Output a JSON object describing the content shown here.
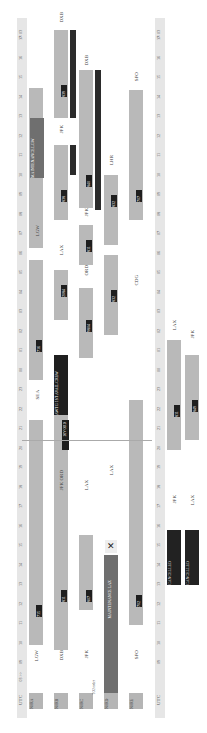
{
  "ruler": {
    "utc_label": "UTC",
    "day_label": "03 >>",
    "hours_bottom": [
      "09",
      "10",
      "11",
      "12",
      "13",
      "14",
      "15",
      "16",
      "17",
      "18",
      "19",
      "20",
      "21",
      "22",
      "23",
      "00",
      "01",
      "02",
      "03",
      "04",
      "05",
      "06",
      "07",
      "08",
      "09",
      "10",
      "11",
      "12",
      "13",
      "14",
      "15",
      "16",
      "17"
    ],
    "end_label": "<< 03"
  },
  "registrations": [
    "N0RA",
    "N0RB",
    "N0RC",
    "N0RD",
    "N0RE"
  ],
  "aircraft_notes": {
    "row3": "TO2 order"
  },
  "rows": [
    {
      "reg": "N0RA",
      "origin": "LGW",
      "flights": [
        {
          "dep": "0900",
          "arr": "1600",
          "flt": "715",
          "alt": "367"
        },
        {
          "dep": "2100",
          "arr": "0000",
          "flt": "716",
          "alt": "300"
        },
        {
          "dep": "0650",
          "arr": "0620",
          "flt": "",
          "alt": ""
        }
      ],
      "stations": [
        "LGW",
        "SEA",
        "LGW"
      ],
      "maint": "MAINTENANCE LGW"
    },
    {
      "reg": "N0RB",
      "origin": "DXB",
      "flights": [
        {
          "dep": "0900",
          "arr": "1800",
          "flt": "811",
          "alt": "329"
        },
        {
          "dep": "2100",
          "arr": "0030",
          "flt": "AWTG 1ST AVAIL CREW",
          "alt": ""
        },
        {
          "dep": "0100",
          "arr": "0630",
          "flt": "2084",
          "alt": "218"
        },
        {
          "dep": "0700",
          "arr": "1313",
          "flt": "838",
          "alt": "390"
        },
        {
          "dep": "1400",
          "arr": "0420",
          "flt": "839",
          "alt": "314"
        }
      ],
      "stations": [
        "DXB",
        "JFK ORD",
        "LAX",
        "JFK",
        "DXB"
      ],
      "note": "DIV ORD"
    },
    {
      "reg": "N0RC",
      "origin": "JFK",
      "flights": [
        {
          "dep": "1600",
          "arr": "1700",
          "flt": "807",
          "alt": "277"
        },
        {
          "dep": "2100",
          "arr": "0400",
          "flt": "9804",
          "alt": ""
        },
        {
          "dep": "0430",
          "arr": "0530",
          "flt": "811",
          "alt": "218"
        },
        {
          "dep": "0630",
          "arr": "2345",
          "flt": "840",
          "alt": "320"
        }
      ],
      "stations": [
        "JFK",
        "LAX",
        "ORD",
        "JFK",
        "DXB"
      ]
    },
    {
      "reg": "N0RD",
      "origin": "LAX",
      "maint": "MAINTENANCE LAX",
      "flights": [
        {
          "dep": "2100",
          "arr": "0445",
          "flt": "832",
          "alt": "390"
        },
        {
          "dep": "0630",
          "arr": "1135",
          "flt": "832",
          "alt": "215"
        }
      ],
      "stations": [
        "LAX",
        "CDG",
        "JFK",
        "LHR"
      ]
    },
    {
      "reg": "N0RE",
      "origin": "SFO",
      "flights": [
        {
          "dep": "1015",
          "arr": "2010",
          "flt": "702",
          "alt": "341"
        },
        {
          "dep": "0900",
          "arr": "1600",
          "flt": "707",
          "alt": "326"
        }
      ],
      "stations": [
        "SFO",
        "LAX",
        "SFO"
      ]
    }
  ],
  "lower": {
    "cancelled": [
      "CANCELLED",
      "CANCELLED"
    ],
    "stations": [
      "JFK",
      "LAX",
      "LAX",
      "JFK"
    ],
    "flights": [
      {
        "dep": "2000",
        "arr": "0230",
        "flt": "811",
        "alt": "325"
      },
      {
        "dep": "2015",
        "arr": "0230",
        "flt": "849",
        "alt": "147"
      }
    ]
  }
}
